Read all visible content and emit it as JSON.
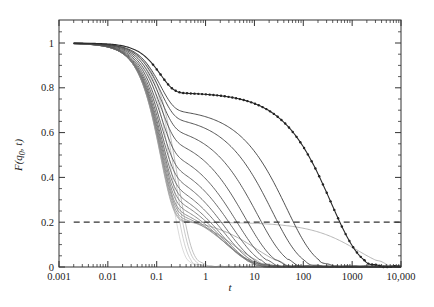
{
  "chart_data": {
    "type": "line",
    "title": "",
    "xlabel": "t",
    "ylabel": "F(q0, t)",
    "ylabel_parts": {
      "main": "F(q",
      "sub": "0",
      "tail": ", t)"
    },
    "xscale": "log",
    "xlim": [
      0.001,
      10000
    ],
    "ylim": [
      0,
      1.1
    ],
    "x_ticks": [
      0.001,
      0.01,
      0.1,
      1,
      10,
      100,
      1000,
      10000
    ],
    "x_tick_labels": [
      "0.001",
      "0.01",
      "0.1",
      "1",
      "10",
      "100",
      "1000",
      "10,000"
    ],
    "y_ticks": [
      0,
      0.2,
      0.4,
      0.6,
      0.8,
      1
    ],
    "y_tick_labels": [
      "0",
      "0.2",
      "0.4",
      "0.6",
      "0.8",
      "1"
    ],
    "grid": false,
    "legend": null,
    "reference_line": {
      "type": "horizontal",
      "y": 0.2,
      "style": "dashed",
      "x_start": 0.002,
      "x_end": 10000
    },
    "t_start": 0.002,
    "series_description": "Family of ~21 intermediate scattering function curves (two-step relaxation); slowest curve drawn with dot markers. Crossing times of F = 0.2 listed as t_cross.",
    "series": [
      {
        "name": "curve-1",
        "t_cross": 0.25,
        "plateau": 0.1,
        "color": "#d6d6d6",
        "markers": false
      },
      {
        "name": "curve-2",
        "t_cross": 0.29,
        "plateau": 0.12,
        "color": "#cccccc",
        "markers": false
      },
      {
        "name": "curve-3",
        "t_cross": 0.33,
        "plateau": 0.15,
        "color": "#c2c2c2",
        "markers": false
      },
      {
        "name": "curve-4",
        "t_cross": 0.37,
        "plateau": 0.18,
        "color": "#b8b8b8",
        "markers": false
      },
      {
        "name": "curve-5",
        "t_cross": 0.42,
        "plateau": 0.2,
        "color": "#aeaeae",
        "markers": false
      },
      {
        "name": "curve-6",
        "t_cross": 0.48,
        "plateau": 0.22,
        "color": "#a4a4a4",
        "markers": false
      },
      {
        "name": "curve-7",
        "t_cross": 0.55,
        "plateau": 0.25,
        "color": "#9a9a9a",
        "markers": false
      },
      {
        "name": "curve-8",
        "t_cross": 0.63,
        "plateau": 0.28,
        "color": "#909090",
        "markers": false
      },
      {
        "name": "curve-9",
        "t_cross": 0.73,
        "plateau": 0.3,
        "color": "#888888",
        "markers": false
      },
      {
        "name": "curve-10",
        "t_cross": 0.87,
        "plateau": 0.33,
        "color": "#808080",
        "markers": false
      },
      {
        "name": "curve-11",
        "t_cross": 1.05,
        "plateau": 0.36,
        "color": "#787878",
        "markers": false
      },
      {
        "name": "curve-12",
        "t_cross": 1.25,
        "plateau": 0.39,
        "color": "#707070",
        "markers": false
      },
      {
        "name": "curve-13",
        "t_cross": 1.6,
        "plateau": 0.42,
        "color": "#686868",
        "markers": false
      },
      {
        "name": "curve-14",
        "t_cross": 2.1,
        "plateau": 0.46,
        "color": "#606060",
        "markers": false
      },
      {
        "name": "curve-15",
        "t_cross": 3.0,
        "plateau": 0.5,
        "color": "#5a5a5a",
        "markers": false
      },
      {
        "name": "curve-16",
        "t_cross": 4.4,
        "plateau": 0.55,
        "color": "#545454",
        "markers": false
      },
      {
        "name": "curve-17",
        "t_cross": 7.3,
        "plateau": 0.6,
        "color": "#4e4e4e",
        "markers": false
      },
      {
        "name": "curve-18",
        "t_cross": 14,
        "plateau": 0.64,
        "color": "#484848",
        "markers": false
      },
      {
        "name": "curve-19",
        "t_cross": 30,
        "plateau": 0.68,
        "color": "#424242",
        "markers": false
      },
      {
        "name": "curve-20",
        "t_cross": 63,
        "plateau": 0.71,
        "color": "#3c3c3c",
        "markers": false
      },
      {
        "name": "curve-21",
        "t_cross": 560,
        "plateau": 0.78,
        "color": "#2a2a2a",
        "markers": true
      }
    ]
  }
}
